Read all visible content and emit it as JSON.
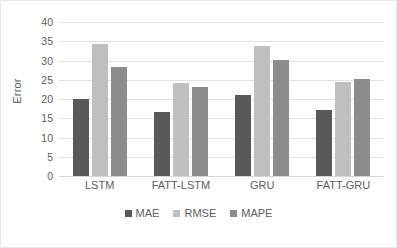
{
  "chart_data": {
    "type": "bar",
    "title": "",
    "xlabel": "",
    "ylabel": "Error",
    "ylim": [
      0,
      40
    ],
    "yticks": [
      40,
      35,
      30,
      25,
      20,
      15,
      10,
      5,
      0
    ],
    "grid": true,
    "legend_position": "bottom",
    "categories": [
      "LSTM",
      "FATT-LSTM",
      "GRU",
      "FATT-GRU"
    ],
    "series": [
      {
        "name": "MAE",
        "color": "#595959",
        "values": [
          20.1,
          16.6,
          21.1,
          17.2
        ]
      },
      {
        "name": "RMSE",
        "color": "#bfbfbf",
        "values": [
          34.2,
          24.1,
          33.9,
          24.4
        ]
      },
      {
        "name": "MAPE",
        "color": "#8c8c8c",
        "values": [
          28.3,
          23.1,
          30.2,
          25.3
        ]
      }
    ]
  },
  "axes": {
    "y_title": "Error"
  }
}
